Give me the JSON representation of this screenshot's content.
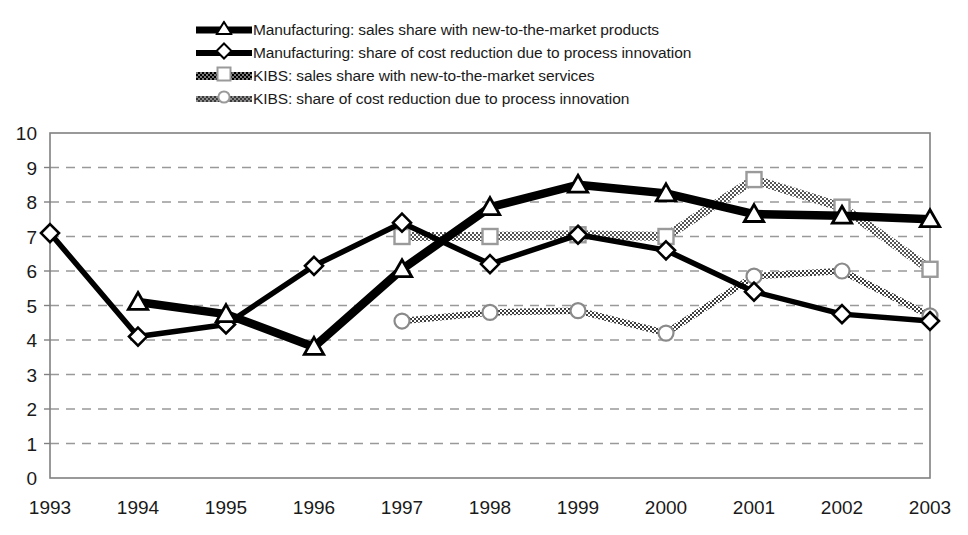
{
  "chart_data": {
    "type": "line",
    "title": "",
    "subtitle": "",
    "xlabel": "",
    "ylabel": "",
    "x": [
      "1993",
      "1994",
      "1995",
      "1996",
      "1997",
      "1998",
      "1999",
      "2000",
      "2001",
      "2002",
      "2003"
    ],
    "categories": [
      "1993",
      "1994",
      "1995",
      "1996",
      "1997",
      "1998",
      "1999",
      "2000",
      "2001",
      "2002",
      "2003"
    ],
    "ylim": [
      0,
      10
    ],
    "ytick_labels": [
      "0",
      "1",
      "2",
      "3",
      "4",
      "5",
      "6",
      "7",
      "8",
      "9",
      "10"
    ],
    "ytick_values": [
      0,
      1,
      2,
      3,
      4,
      5,
      6,
      7,
      8,
      9,
      10
    ],
    "grid": "horizontal-dashed",
    "legend_position": "top",
    "series": [
      {
        "name": "Manufacturing: sales share with new-to-the-market products",
        "key": "mfg_sales",
        "marker": "triangle",
        "line_style": "thick-solid-black",
        "color": "#000000",
        "x": [
          "1994",
          "1995",
          "1996",
          "1997",
          "1998",
          "1999",
          "2000",
          "2001",
          "2002",
          "2003"
        ],
        "values": [
          5.1,
          4.75,
          3.8,
          6.05,
          7.85,
          8.5,
          8.25,
          7.65,
          7.6,
          7.5
        ]
      },
      {
        "name": "Manufacturing: share of cost reduction due to process innovation",
        "key": "mfg_cost",
        "marker": "diamond",
        "line_style": "solid-black",
        "color": "#000000",
        "x": [
          "1993",
          "1994",
          "1995",
          "1996",
          "1997",
          "1998",
          "1999",
          "2000",
          "2001",
          "2002",
          "2003"
        ],
        "values": [
          7.1,
          4.1,
          4.45,
          6.15,
          7.4,
          6.2,
          7.05,
          6.6,
          5.4,
          4.75,
          4.55
        ]
      },
      {
        "name": "KIBS: sales share with new-to-the-market services",
        "key": "kibs_sales",
        "marker": "square",
        "line_style": "thick-dither-gray",
        "color": "#808080",
        "x": [
          "1997",
          "1998",
          "1999",
          "2000",
          "2001",
          "2002",
          "2003"
        ],
        "values": [
          7.0,
          7.0,
          7.05,
          7.0,
          8.65,
          7.85,
          6.05
        ]
      },
      {
        "name": "KIBS: share of cost reduction due to process innovation",
        "key": "kibs_cost",
        "marker": "circle",
        "line_style": "dither-gray",
        "color": "#8c8c8c",
        "x": [
          "1997",
          "1998",
          "1999",
          "2000",
          "2001",
          "2002",
          "2003"
        ],
        "values": [
          4.55,
          4.8,
          4.85,
          4.2,
          5.85,
          6.0,
          4.7
        ]
      }
    ]
  },
  "legend": {
    "items": [
      {
        "label": "Manufacturing: sales share with new-to-the-market products",
        "swatch": "thick-black",
        "marker": "triangle-marker-icon"
      },
      {
        "label": "Manufacturing: share of cost reduction due to process innovation",
        "swatch": "thin-black",
        "marker": "diamond-marker-icon"
      },
      {
        "label": "KIBS: sales share with new-to-the-market services",
        "swatch": "kibs-sales",
        "marker": "square-marker-icon"
      },
      {
        "label": "KIBS: share of cost reduction due to process innovation",
        "swatch": "kibs-cost",
        "marker": "circle-marker-icon"
      }
    ]
  },
  "colors": {
    "manufacturing": "#000000",
    "kibs_sales": "#808080",
    "kibs_cost": "#8c8c8c",
    "gridline": "#999999",
    "axis": "#808080",
    "background": "#ffffff"
  }
}
